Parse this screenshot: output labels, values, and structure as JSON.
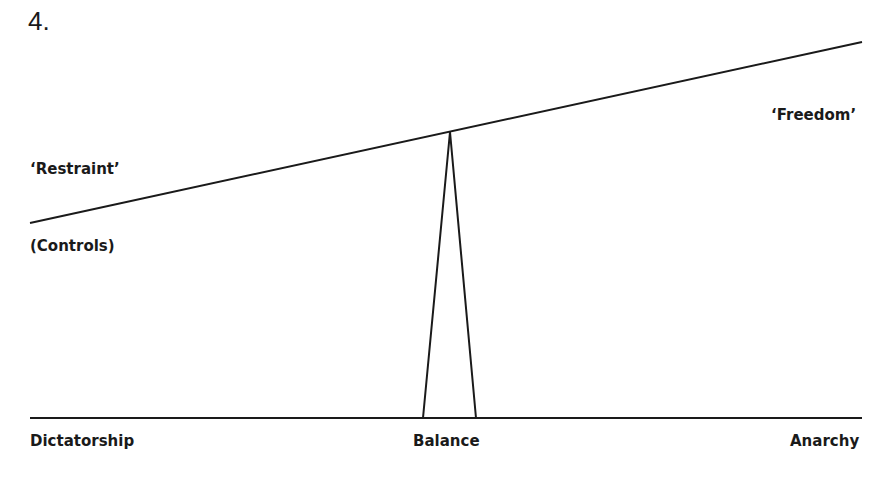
{
  "figure": {
    "number": "4.",
    "labels": {
      "restraint": "‘Restraint’",
      "controls": "(Controls)",
      "freedom": "‘Freedom’",
      "dictatorship": "Dictatorship",
      "balance": "Balance",
      "anarchy": "Anarchy"
    },
    "line_color": "#1a1a1a"
  }
}
